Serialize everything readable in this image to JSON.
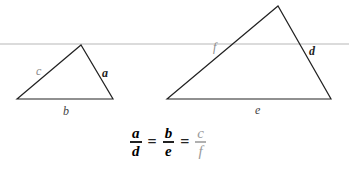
{
  "diagram": {
    "reference_line": {
      "y": 44,
      "color": "#c8c8c8"
    },
    "small_triangle": {
      "vertices": [
        [
          17,
          99
        ],
        [
          81,
          45
        ],
        [
          113,
          99
        ]
      ],
      "labels": {
        "c": {
          "text": "c",
          "color": "#8a8a8a"
        },
        "a": {
          "text": "a",
          "color": "#222222"
        },
        "b": {
          "text": "b",
          "color": "#444444"
        }
      }
    },
    "large_triangle": {
      "vertices": [
        [
          167,
          99
        ],
        [
          278,
          6
        ],
        [
          331,
          99
        ]
      ],
      "labels": {
        "f": {
          "text": "f",
          "color": "#8a8a8a"
        },
        "d": {
          "text": "d",
          "color": "#222222"
        },
        "e": {
          "text": "e",
          "color": "#444444"
        }
      }
    },
    "equation": {
      "fractions": [
        {
          "num": "a",
          "den": "d"
        },
        {
          "num": "b",
          "den": "e"
        },
        {
          "num": "c",
          "den": "f"
        }
      ],
      "operator": "="
    }
  }
}
